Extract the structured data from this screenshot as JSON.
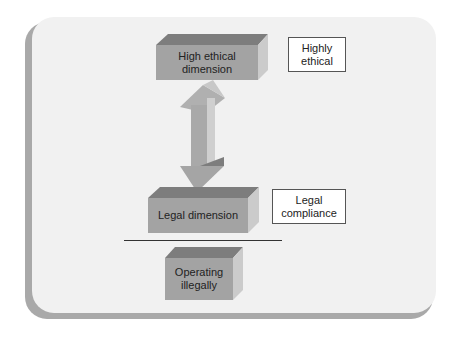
{
  "diagram": {
    "levels": [
      {
        "id": "high-ethical",
        "label": "High ethical dimension",
        "line1": "High ethical",
        "line2": "dimension",
        "annotation_line1": "Highly",
        "annotation_line2": "ethical"
      },
      {
        "id": "legal",
        "label": "Legal dimension",
        "annotation_line1": "Legal",
        "annotation_line2": "compliance"
      },
      {
        "id": "illegal",
        "label": "Operating illegally",
        "line1": "Operating",
        "line2": "illegally"
      }
    ],
    "connector": "double-headed-arrow between High ethical dimension and Legal dimension",
    "colors": {
      "box_front": "#a3a3a3",
      "box_top": "#7d7d7d",
      "box_side": "#cbcbcb",
      "card": "#f1f1f1"
    }
  }
}
